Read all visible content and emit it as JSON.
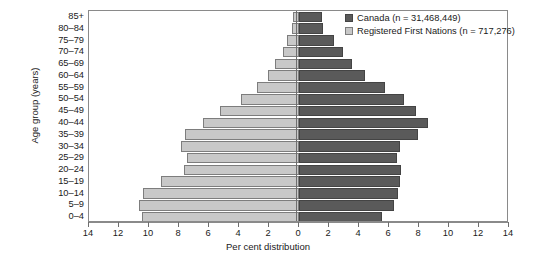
{
  "chart_data": {
    "type": "bar",
    "subtype": "population-pyramid",
    "title": "",
    "xlabel": "Per cent distribution",
    "ylabel": "Age group (years)",
    "xlim": [
      -14,
      14
    ],
    "x_ticks": [
      14,
      12,
      10,
      8,
      6,
      4,
      2,
      0,
      2,
      4,
      6,
      8,
      10,
      12,
      14
    ],
    "x_tick_labels": [
      "14",
      "12",
      "10",
      "8",
      "6",
      "4",
      "2",
      "0",
      "2",
      "4",
      "6",
      "8",
      "10",
      "12",
      "14"
    ],
    "grid": false,
    "legend_position": "top-right",
    "categories": [
      "85+",
      "80-84",
      "75-79",
      "70-74",
      "65-69",
      "60-64",
      "55-59",
      "50-54",
      "45-49",
      "40-44",
      "35-39",
      "30-34",
      "25-29",
      "20-24",
      "15-19",
      "10-14",
      "5-9",
      "0-4"
    ],
    "series": [
      {
        "name": "Registered First Nations (n = 717,276)",
        "side": "left",
        "color": "#c8c8c8",
        "values": [
          0.4,
          0.5,
          0.8,
          1.1,
          1.6,
          2.1,
          2.8,
          3.9,
          5.3,
          6.4,
          7.6,
          7.9,
          7.5,
          7.7,
          9.2,
          10.4,
          10.7,
          10.5
        ]
      },
      {
        "name": "Canada (n = 31,468,449)",
        "side": "right",
        "color": "#5a5a5a",
        "values": [
          1.5,
          1.6,
          2.3,
          2.9,
          3.5,
          4.4,
          5.7,
          7.0,
          7.8,
          8.6,
          7.9,
          6.7,
          6.5,
          6.8,
          6.7,
          6.6,
          6.3,
          5.5
        ]
      }
    ]
  },
  "axes": {
    "x_title": "Per cent distribution",
    "y_title": "Age group (years)"
  },
  "legend": {
    "items": [
      {
        "label": "Canada (n = 31,468,449)",
        "swatch": "canada",
        "color": "#5a5a5a"
      },
      {
        "label": "Registered First Nations (n = 717,276)",
        "swatch": "rfn",
        "color": "#c8c8c8"
      }
    ]
  }
}
